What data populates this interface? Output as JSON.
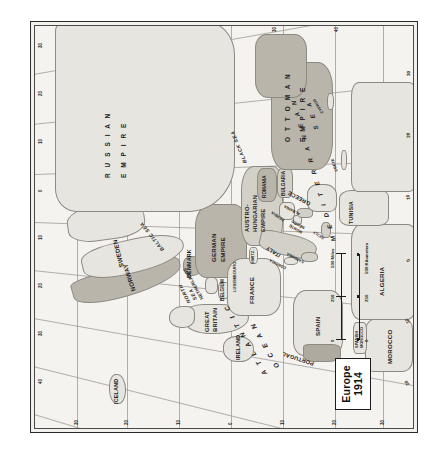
{
  "map": {
    "title_line1": "Europe",
    "title_line2": "1914",
    "frame_bg": "#f2f1ee",
    "accent_border": "#2b2b2b"
  },
  "scale": {
    "miles_label": "500 Miles",
    "km_label": "500 Kilometers",
    "miles_ticks": [
      "0",
      "250",
      "500"
    ],
    "km_ticks": [
      "0",
      "250",
      "500"
    ]
  },
  "graticule": {
    "latitude_labels": [
      "60",
      "50",
      "40",
      "30"
    ],
    "longitude_labels": [
      "20",
      "10",
      "0",
      "10",
      "20",
      "30",
      "40",
      "50"
    ],
    "left_edge_ticks": [
      "40",
      "30",
      "20",
      "10",
      "0",
      "10",
      "20",
      "30"
    ],
    "bottom_edge_ticks": [
      "30",
      "20",
      "10",
      "0",
      "10",
      "20",
      "30",
      "40",
      "50"
    ],
    "right_edge_ticks": [
      "30",
      "40"
    ]
  },
  "labels": {
    "empires": [
      {
        "name": "RUSSIAN EMPIRE",
        "line1": "R U S S I A N",
        "line2": "E M P I R E"
      },
      {
        "name": "OTTOMAN EMPIRE",
        "line1": "O T T O M A N",
        "line2": "E M P I R E"
      }
    ],
    "countries": [
      "NORWAY",
      "SWEDEN",
      "DENMARK",
      "GERMAN EMPIRE",
      "AUSTRO-HUNGARIAN EMPIRE",
      "ROMANIA",
      "BULGARIA",
      "SERBIA",
      "MONTE NEGRO",
      "ALBANIA",
      "GREECE",
      "ITALY",
      "SWITZ.",
      "FRANCE",
      "SPAIN",
      "PORTUGAL",
      "BELGIUM",
      "LUXEMBOURG",
      "NETHERLANDS",
      "GREAT BRITAIN",
      "IRELAND",
      "ICELAND",
      "MOROCCO",
      "SPANISH MOROCCO",
      "ALGERIA",
      "TUNISIA"
    ],
    "german_empire_l1": "GERMAN",
    "german_empire_l2": "EMPIRE",
    "austro_l1": "AUSTRO-",
    "austro_l2": "HUNGARIAN",
    "austro_l3": "EMPIRE",
    "great_britain_l1": "GREAT",
    "great_britain_l2": "BRITAIN",
    "monte_l1": "MONTE",
    "monte_l2": "NEGRO",
    "sp_morocco_l1": "SPANISH",
    "sp_morocco_l2": "MOROCCO",
    "islands": [
      "SICILY",
      "SARDINIA",
      "CORSICA",
      "CRETE",
      "CYPRUS"
    ],
    "seas": [
      "BALTIC SEA",
      "NORTH SEA",
      "BLACK SEA"
    ],
    "north_sea_l1": "NORTH",
    "north_sea_l2": "SEA",
    "oceans": [
      {
        "line1": "A T L A N T I C",
        "line2": "O C E A N"
      }
    ],
    "mediterranean_l1": "M E D I T E R R A N E A N",
    "mediterranean_l2": "S E A"
  }
}
